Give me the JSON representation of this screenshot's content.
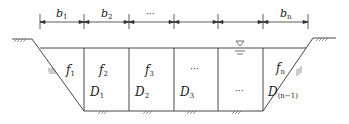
{
  "diagram": {
    "type": "channel-cross-section",
    "dimension_labels": [
      {
        "base": "b",
        "sub": "1"
      },
      {
        "base": "b",
        "sub": "2"
      },
      {
        "base": "",
        "sub": "",
        "text": "···"
      },
      {
        "base": "b",
        "sub": "n"
      }
    ],
    "section_labels_f": [
      {
        "base": "f",
        "sub": "1"
      },
      {
        "base": "f",
        "sub": "2"
      },
      {
        "base": "f",
        "sub": "3"
      },
      {
        "base": "",
        "sub": "",
        "text": "···"
      },
      {
        "base": "f",
        "sub": "n"
      }
    ],
    "section_labels_d": [
      {
        "base": "D",
        "sub": "1"
      },
      {
        "base": "D",
        "sub": "2"
      },
      {
        "base": "D",
        "sub": "3"
      },
      {
        "base": "",
        "sub": "",
        "text": "···"
      },
      {
        "base": "D",
        "sub": "(n−1)"
      }
    ],
    "symbols": {
      "water_level": "water-surface-triangle",
      "ground": "ground-hatch"
    },
    "colors": {
      "line": "#333333",
      "background": "#ffffff"
    }
  }
}
